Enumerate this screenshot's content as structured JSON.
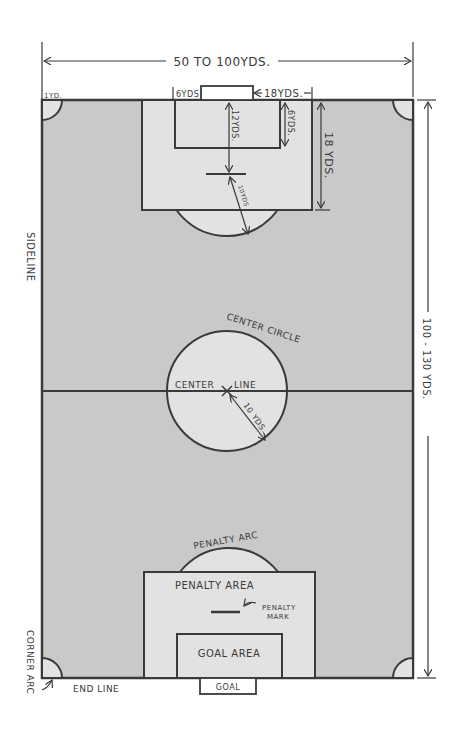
{
  "diagram": {
    "colors": {
      "field": "#c9c9c9",
      "areas": "#e2e2e2",
      "ink": "#3a3a3a",
      "background": "#ffffff"
    },
    "dimensions": {
      "width_label": "50 TO 100YDS.",
      "length_label": "100 - 130 YDS.",
      "corner_label": "1YD.",
      "goal_area_width_label": "6YDS",
      "penalty_area_width_label": "18YDS.",
      "penalty_spot_label": "12YDS.",
      "goal_area_depth_label": "6YDS.",
      "penalty_area_depth_label": "18 YDS.",
      "penalty_arc_radius_label": "10YDS",
      "center_circle_radius_label": "10 YDS."
    },
    "labels": {
      "sideline": "SIDELINE",
      "center_circle": "CENTER CIRCLE",
      "center_line_left": "CENTER",
      "center_line_right": "LINE",
      "penalty_arc": "PENALTY ARC",
      "penalty_area": "PENALTY AREA",
      "penalty_mark_1": "PENALTY",
      "penalty_mark_2": "MARK",
      "goal_area": "GOAL AREA",
      "goal": "GOAL",
      "end_line": "END LINE",
      "corner_arc": "CORNER ARC"
    }
  }
}
